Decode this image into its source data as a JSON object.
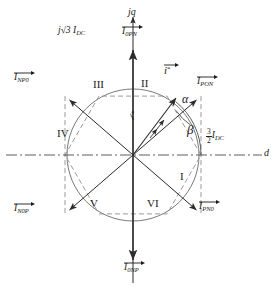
{
  "diagram": {
    "type": "space-vector-hexagon",
    "center": {
      "x": 133,
      "y": 155
    },
    "hexagon_radius": 68,
    "circle_radius": 66,
    "axes": {
      "horizontal_label": "d",
      "vertical_label": "jq",
      "horizontal_style": "dash-dot",
      "vertical_style": "solid-arrow"
    },
    "magnitude_labels": {
      "vertical": {
        "text": "j√3 I",
        "sub": "DC",
        "full": "j√3 I_DC"
      },
      "horizontal": {
        "num": "3",
        "den": "2",
        "text": "I",
        "sub": "DC",
        "full": "3/2 I_DC"
      }
    },
    "reference_vector": {
      "label": "i",
      "superscript": "*",
      "alpha": "α",
      "beta": "β",
      "angle_deg": 52
    },
    "vectors": [
      {
        "name": "I",
        "sub": "PON",
        "angle_deg": 0,
        "label_x": 197,
        "label_y": 78,
        "id": "vector-pon"
      },
      {
        "name": "I",
        "sub": "0PN",
        "angle_deg": 60,
        "label_x": 133,
        "label_y": 26,
        "id": "vector-0pn"
      },
      {
        "name": "I",
        "sub": "NP0",
        "angle_deg": 120,
        "label_x": 10,
        "label_y": 72,
        "id": "vector-np0"
      },
      {
        "name": "I",
        "sub": "N0P",
        "angle_deg": 180,
        "label_x": 11,
        "label_y": 204,
        "id": "vector-n0p"
      },
      {
        "name": "I",
        "sub": "0NP",
        "angle_deg": 240,
        "label_x": 131,
        "label_y": 262,
        "id": "vector-0np"
      },
      {
        "name": "I",
        "sub": "PN0",
        "angle_deg": 300,
        "label_x": 197,
        "label_y": 203,
        "id": "vector-pn0"
      }
    ],
    "sectors": [
      {
        "label": "I",
        "x": 180,
        "y": 178
      },
      {
        "label": "II",
        "x": 143,
        "y": 84
      },
      {
        "label": "III",
        "x": 97,
        "y": 86
      },
      {
        "label": "IV",
        "x": 62,
        "y": 134
      },
      {
        "label": "V",
        "x": 92,
        "y": 204
      },
      {
        "label": "VI",
        "x": 152,
        "y": 204
      }
    ],
    "colors": {
      "line": "#333333",
      "dashed": "#8a8a8a",
      "circle": "#555555",
      "text": "#1a1a1a",
      "background": "#ffffff"
    }
  }
}
